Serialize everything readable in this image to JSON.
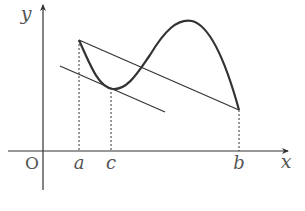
{
  "diagram": {
    "type": "function-graph",
    "colors": {
      "ink": "#333333",
      "label": "#555555",
      "background": "#ffffff"
    },
    "axes": {
      "x_label": "x",
      "y_label": "y",
      "origin_label": "O"
    },
    "points": {
      "a_label": "a",
      "c_label": "c",
      "b_label": "b"
    },
    "elements": [
      "x-axis",
      "y-axis",
      "curve",
      "secant-line",
      "tangent-line",
      "dashed-guide-a",
      "dashed-guide-c",
      "dashed-guide-b"
    ]
  }
}
